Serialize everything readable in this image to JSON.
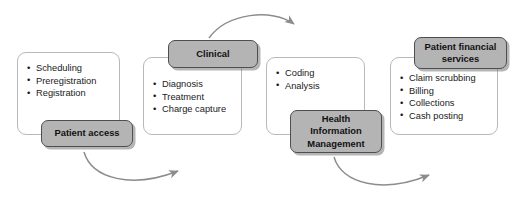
{
  "diagram": {
    "type": "process-flow",
    "colors": {
      "chip_fill": "#b4b4b4",
      "chip_border": "#4e4e4e",
      "panel_border": "#b8b8b8",
      "arrow": "#8c8c8c",
      "text": "#111111",
      "background": "#ffffff"
    },
    "stages": [
      {
        "id": "patient-access",
        "label": "Patient access",
        "label_lines": [
          "Patient access"
        ],
        "label_position": "bottom",
        "items": [
          "Scheduling",
          "Preregistration",
          "Registration"
        ]
      },
      {
        "id": "clinical",
        "label": "Clinical",
        "label_lines": [
          "Clinical"
        ],
        "label_position": "top",
        "items": [
          "Diagnosis",
          "Treatment",
          "Charge capture"
        ]
      },
      {
        "id": "health-information-management",
        "label": "Health Information Management",
        "label_lines": [
          "Health",
          "Information",
          "Management"
        ],
        "label_position": "bottom",
        "items": [
          "Coding",
          "Analysis"
        ]
      },
      {
        "id": "patient-financial-services",
        "label": "Patient financial services",
        "label_lines": [
          "Patient financial",
          "services"
        ],
        "label_position": "top",
        "items": [
          "Claim scrubbing",
          "Billing",
          "Collections",
          "Cash posting"
        ]
      }
    ],
    "connectors": [
      {
        "id": "patient-access-to-clinical",
        "from": "patient-access",
        "to": "clinical",
        "side": "bottom"
      },
      {
        "id": "clinical-to-him",
        "from": "clinical",
        "to": "health-information-management",
        "side": "top"
      },
      {
        "id": "him-to-pfs",
        "from": "health-information-management",
        "to": "patient-financial-services",
        "side": "bottom"
      }
    ]
  }
}
